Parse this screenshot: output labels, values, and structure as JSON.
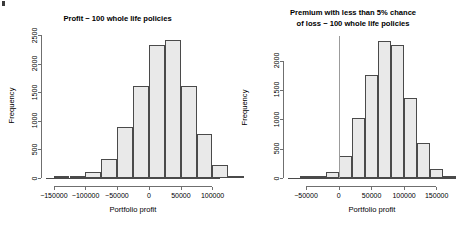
{
  "figure": {
    "background": "#ffffff",
    "bar_fill": "#e9e9e9",
    "bar_border": "#4a4a4a",
    "axis_color": "#6f6f6f",
    "refline_color": "#9b9b9b",
    "corner_mark": "mark"
  },
  "chart_data": [
    {
      "type": "bar",
      "id": "profit-histogram",
      "title": "Profit − 100 whole life policies",
      "xlabel": "Portfolio profit",
      "ylabel": "Frequency",
      "xlim": [
        -162000,
        112000
      ],
      "ylim": [
        0,
        2560
      ],
      "grid": false,
      "legend": "none",
      "xticks": [
        -150000,
        -100000,
        -50000,
        0,
        50000,
        100000
      ],
      "xtick_labels": [
        "−150000",
        "−100000",
        "−50000",
        "0",
        "50000",
        "100000"
      ],
      "yticks": [
        0,
        500,
        1000,
        1500,
        2000,
        2500
      ],
      "ytick_labels": [
        "0",
        "500",
        "1000",
        "1500",
        "2000",
        "2500"
      ],
      "bin_width": 25000,
      "bins": [
        {
          "x0": -150000,
          "x1": -125000,
          "value": 5
        },
        {
          "x0": -125000,
          "x1": -100000,
          "value": 25
        },
        {
          "x0": -100000,
          "x1": -75000,
          "value": 110
        },
        {
          "x0": -75000,
          "x1": -50000,
          "value": 340
        },
        {
          "x0": -50000,
          "x1": -25000,
          "value": 900
        },
        {
          "x0": -25000,
          "x1": 0,
          "value": 1610
        },
        {
          "x0": 0,
          "x1": 25000,
          "value": 2330
        },
        {
          "x0": 25000,
          "x1": 50000,
          "value": 2420
        },
        {
          "x0": 50000,
          "x1": 75000,
          "value": 1620
        },
        {
          "x0": 75000,
          "x1": 100000,
          "value": 770
        },
        {
          "x0": 100000,
          "x1": 125000,
          "value": 230
        },
        {
          "x0": 125000,
          "x1": 150000,
          "value": 35
        }
      ],
      "bins_display_note": "bars drawn centered on data; axis origin at 0"
    },
    {
      "type": "bar",
      "id": "premium-histogram",
      "title_line1": "Premium with less than 5% chance",
      "title_line2": "of loss − 100 whole life policies",
      "title": "Premium with less than 5% chance of loss − 100 whole life policies",
      "xlabel": "Portfolio profit",
      "ylabel": "Frequency",
      "xlim": [
        -78000,
        180000
      ],
      "ylim": [
        0,
        2420
      ],
      "grid": false,
      "legend": "none",
      "reference_line_x": 0,
      "xticks": [
        -50000,
        0,
        50000,
        100000,
        150000
      ],
      "xtick_labels": [
        "−50000",
        "0",
        "50000",
        "100000",
        "150000"
      ],
      "yticks": [
        0,
        500,
        1000,
        1500,
        2000
      ],
      "ytick_labels": [
        "0",
        "500",
        "1000",
        "1500",
        "2000"
      ],
      "bin_width": 20000,
      "bins": [
        {
          "x0": -60000,
          "x1": -40000,
          "value": 8
        },
        {
          "x0": -40000,
          "x1": -20000,
          "value": 30
        },
        {
          "x0": -20000,
          "x1": 0,
          "value": 110
        },
        {
          "x0": 0,
          "x1": 20000,
          "value": 375
        },
        {
          "x0": 20000,
          "x1": 40000,
          "value": 1020
        },
        {
          "x0": 40000,
          "x1": 60000,
          "value": 1750
        },
        {
          "x0": 60000,
          "x1": 80000,
          "value": 2330
        },
        {
          "x0": 80000,
          "x1": 100000,
          "value": 2270
        },
        {
          "x0": 100000,
          "x1": 120000,
          "value": 1370
        },
        {
          "x0": 120000,
          "x1": 140000,
          "value": 600
        },
        {
          "x0": 140000,
          "x1": 160000,
          "value": 155
        },
        {
          "x0": 160000,
          "x1": 180000,
          "value": 30
        }
      ]
    }
  ]
}
